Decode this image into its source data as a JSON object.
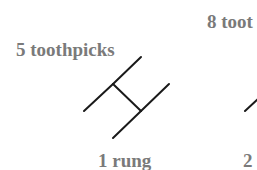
{
  "figure": {
    "panels": [
      {
        "count_label": "5 toothpicks",
        "rung_label": "1 rung",
        "toothpicks": 5,
        "rungs": 1
      },
      {
        "count_label": "8 toot",
        "rung_label": "2",
        "toothpicks": 8,
        "rungs": 2
      }
    ],
    "colors": {
      "text": "#7a7a7a",
      "stick": "#1a1a1a",
      "background": "#ffffff"
    }
  }
}
